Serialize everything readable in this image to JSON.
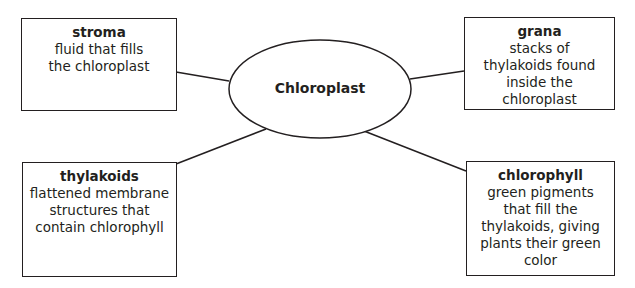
{
  "center": {
    "label": "Chloroplast"
  },
  "nodes": [
    {
      "id": "stroma",
      "term": "stroma",
      "definition": "fluid that fills the chloroplast"
    },
    {
      "id": "grana",
      "term": "grana",
      "definition": "stacks of  thylakoids found inside the chloroplast"
    },
    {
      "id": "thylakoids",
      "term": "thylakoids",
      "definition": "flattened membrane structures that contain chlorophyll"
    },
    {
      "id": "chlorophyll",
      "term": "chlorophyll",
      "definition": "green pigments that fill the thylakoids, giving plants their green color"
    }
  ],
  "colors": {
    "stroke": "#231f20",
    "background": "#ffffff"
  }
}
